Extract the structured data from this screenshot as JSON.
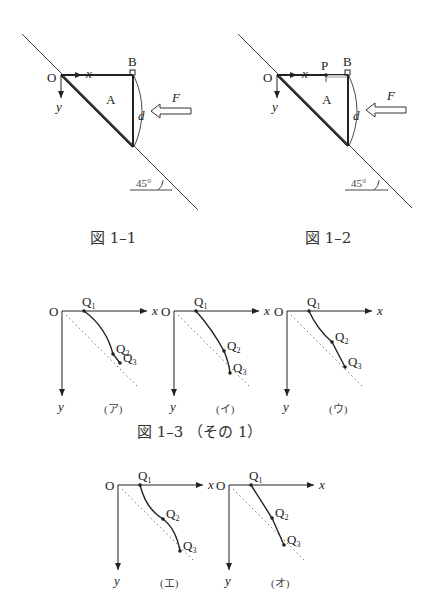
{
  "figures": {
    "fig1_1": {
      "caption": "図 1–1",
      "labels": {
        "origin": "O",
        "x_axis": "x",
        "y_axis": "y",
        "corner": "B",
        "region": "A",
        "distance": "d",
        "force": "F",
        "angle": "45°"
      }
    },
    "fig1_2": {
      "caption": "図 1–2",
      "labels": {
        "origin": "O",
        "x_axis": "x",
        "y_axis": "y",
        "point": "P",
        "corner": "B",
        "region": "A",
        "distance": "d",
        "force": "F",
        "angle": "45°"
      }
    },
    "fig1_3": {
      "caption": "図 1–3 （その 1）",
      "panels": [
        {
          "id": "a",
          "label": "(ア)",
          "curve": "concave-down",
          "origin": "O",
          "x_axis": "x",
          "y_axis": "y",
          "points": [
            "Q1",
            "Q2",
            "Q3"
          ]
        },
        {
          "id": "i",
          "label": "(イ)",
          "curve": "concave-down-mild",
          "origin": "O",
          "x_axis": "x",
          "y_axis": "y",
          "points": [
            "Q1",
            "Q2",
            "Q3"
          ]
        },
        {
          "id": "u",
          "label": "(ウ)",
          "curve": "kinked",
          "origin": "O",
          "x_axis": "x",
          "y_axis": "y",
          "points": [
            "Q1",
            "Q2",
            "Q3"
          ]
        },
        {
          "id": "e",
          "label": "(エ)",
          "curve": "s-shaped",
          "origin": "O",
          "x_axis": "x",
          "y_axis": "y",
          "points": [
            "Q1",
            "Q2",
            "Q3"
          ]
        },
        {
          "id": "o",
          "label": "(オ)",
          "curve": "straight",
          "origin": "O",
          "x_axis": "x",
          "y_axis": "y",
          "points": [
            "Q1",
            "Q2",
            "Q3"
          ]
        }
      ]
    }
  }
}
